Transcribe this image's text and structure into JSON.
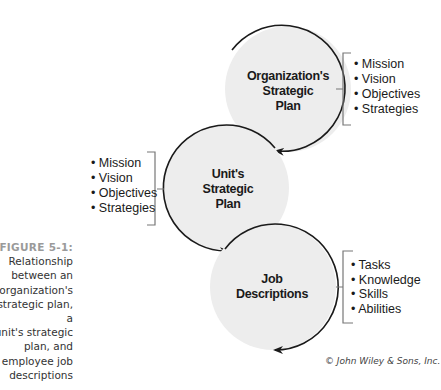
{
  "figure": {
    "label": "FIGURE 5-1:",
    "caption_lines": [
      "Relationship",
      "between an",
      "organization's",
      "strategic plan, a",
      "unit's strategic",
      "plan, and",
      "employee job",
      "descriptions"
    ],
    "credit": "© John Wiley & Sons, Inc."
  },
  "nodes": [
    {
      "name": "organization-strategic-plan",
      "label_lines": [
        "Organization's",
        "Strategic",
        "Plan"
      ],
      "items": [
        "• Mission",
        "• Vision",
        "• Objectives",
        "• Strategies"
      ],
      "items_side": "right"
    },
    {
      "name": "unit-strategic-plan",
      "label_lines": [
        "Unit's",
        "Strategic",
        "Plan"
      ],
      "items": [
        "• Mission",
        "• Vision",
        "• Objectives",
        "• Strategies"
      ],
      "items_side": "left"
    },
    {
      "name": "job-descriptions",
      "label_lines": [
        "Job",
        "Descriptions"
      ],
      "items": [
        "• Tasks",
        "• Knowledge",
        "• Skills",
        "• Abilities"
      ],
      "items_side": "right"
    }
  ],
  "colors": {
    "circle_fill": "#ededed",
    "stroke": "#1a1a1a",
    "bracket": "#777777"
  }
}
